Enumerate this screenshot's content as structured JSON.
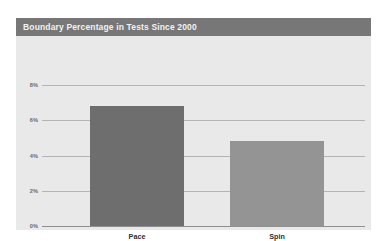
{
  "chart": {
    "title": "Boundary Percentage in Tests Since 2000",
    "title_bar_color": "#777777",
    "panel_color": "#e9e9e9",
    "gridline_color": "#b4b4b4",
    "axis_color": "#8f8f8f"
  },
  "chart_data": {
    "type": "bar",
    "title": "Boundary Percentage in Tests Since 2000",
    "xlabel": "",
    "ylabel": "",
    "categories": [
      "Pace",
      "Spin"
    ],
    "values": [
      6.8,
      4.8
    ],
    "series": [
      {
        "name": "Boundary Percentage",
        "values": [
          6.8,
          4.8
        ],
        "colors": [
          "#6e6e6e",
          "#949494"
        ]
      }
    ],
    "ylim": [
      0,
      8
    ],
    "yticks": [
      0,
      2,
      4,
      6,
      8
    ],
    "ytick_labels": [
      "0%",
      "2%",
      "4%",
      "6%",
      "8%"
    ],
    "grid": true,
    "legend": false,
    "value_unit": "%"
  }
}
